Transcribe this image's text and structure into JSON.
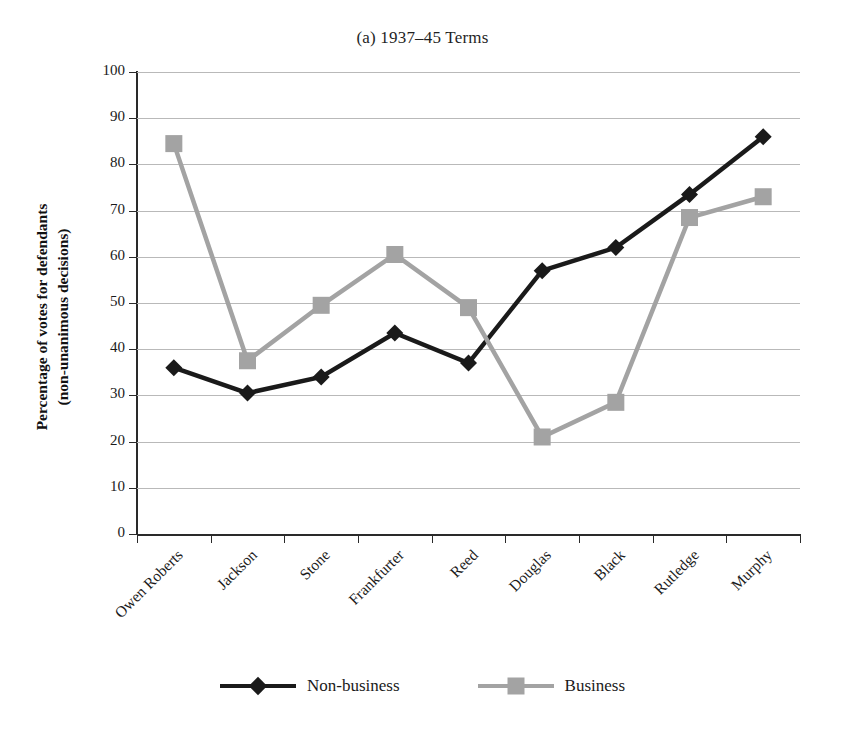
{
  "chart_data": {
    "type": "line",
    "title": "(a) 1937–45 Terms",
    "xlabel": "",
    "ylabel_line1": "Percentage of votes for defendants",
    "ylabel_line2": "(non-unanimous decisions)",
    "categories": [
      "Owen Roberts",
      "Jackson",
      "Stone",
      "Frankfurter",
      "Reed",
      "Douglas",
      "Black",
      "Rutledge",
      "Murphy"
    ],
    "series": [
      {
        "name": "Non-business",
        "color": "#1a1a1a",
        "marker": "diamond",
        "values": [
          36,
          30.5,
          34,
          43.5,
          37,
          57,
          62,
          73.5,
          86
        ]
      },
      {
        "name": "Business",
        "color": "#a3a3a3",
        "marker": "square",
        "values": [
          84.5,
          37.5,
          49.5,
          60.5,
          49,
          21,
          28.5,
          68.5,
          73
        ]
      }
    ],
    "ylim": [
      0,
      100
    ],
    "yticks": [
      100,
      90,
      80,
      70,
      60,
      50,
      40,
      30,
      20,
      10,
      0
    ],
    "ytick_labels": [
      "100",
      "90",
      "80",
      "70",
      "60",
      "50",
      "40",
      "30",
      "20",
      "10",
      "0"
    ],
    "grid": true,
    "legend_position": "bottom"
  },
  "legend": {
    "entries": [
      {
        "label": "Non-business"
      },
      {
        "label": "Business"
      }
    ]
  }
}
